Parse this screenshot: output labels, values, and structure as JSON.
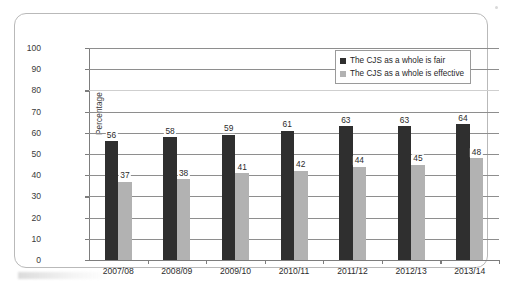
{
  "chart_data": {
    "type": "bar",
    "title": "",
    "xlabel": "",
    "ylabel": "Percentage",
    "ylim": [
      0,
      100
    ],
    "ytick_step": 10,
    "yticks": [
      0,
      10,
      20,
      30,
      40,
      50,
      60,
      70,
      80,
      90,
      100
    ],
    "grid": true,
    "legend_position": "top-right",
    "categories": [
      "2007/08",
      "2008/09",
      "2009/10",
      "2010/11",
      "2011/12",
      "2012/13",
      "2013/14"
    ],
    "series": [
      {
        "name": "The CJS as a whole is fair",
        "color": "#2f2f2f",
        "values": [
          56,
          58,
          59,
          61,
          63,
          63,
          64
        ]
      },
      {
        "name": "The CJS as a whole is effective",
        "color": "#b2b2b2",
        "values": [
          37,
          38,
          41,
          42,
          44,
          45,
          48
        ]
      }
    ]
  },
  "legend": {
    "items": [
      {
        "label": "The CJS as a whole is fair",
        "color": "#2f2f2f"
      },
      {
        "label": "The CJS as a whole is effective",
        "color": "#b2b2b2"
      }
    ]
  },
  "axes": {
    "y_title": "Percentage"
  }
}
